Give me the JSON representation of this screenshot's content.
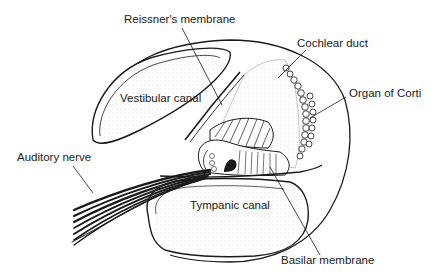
{
  "diagram": {
    "labels": {
      "reissners_membrane": "Reissner's membrane",
      "cochlear_duct": "Cochlear duct",
      "organ_of_corti": "Organ of Corti",
      "vestibular_canal": "Vestibular canal",
      "auditory_nerve": "Auditory nerve",
      "tympanic_canal": "Tympanic canal",
      "basilar_membrane": "Basilar membrane"
    },
    "colors": {
      "ink": "#1a1a1a",
      "background": "#ffffff"
    }
  }
}
